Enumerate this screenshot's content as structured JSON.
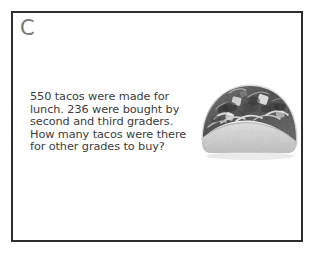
{
  "worksheet": {
    "problem_letter": "C",
    "problem_lines": [
      "550 tacos were made for",
      "lunch. 236 were bought by",
      "second and third graders.",
      "How many tacos were there",
      "for other grades to buy?"
    ],
    "problem_text": "550 tacos were made for lunch. 236 were bought by second and third graders. How many tacos were there for other grades to buy?",
    "numbers": {
      "total_tacos_made": 550,
      "tacos_bought_by_second_and_third_graders": 236
    },
    "illustration": {
      "name": "taco-photo",
      "alt": "Grayscale photograph of a hard-shell taco filled with meat, cheese and lettuce"
    },
    "colors": {
      "border": "#2e2e2e",
      "page_background": "#ffffff",
      "card_background": "#ffffff",
      "letter": "#777777",
      "text": "#3b3b3b"
    }
  }
}
